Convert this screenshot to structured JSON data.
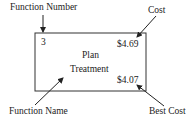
{
  "diagram": {
    "labels": {
      "function_number": "Function Number",
      "cost": "Cost",
      "function_name": "Function Name",
      "best_cost": "Best Cost"
    },
    "node": {
      "number": "3",
      "name_line1": "Plan",
      "name_line2": "Treatment",
      "cost": "$4.69",
      "best_cost": "$4.07"
    }
  }
}
